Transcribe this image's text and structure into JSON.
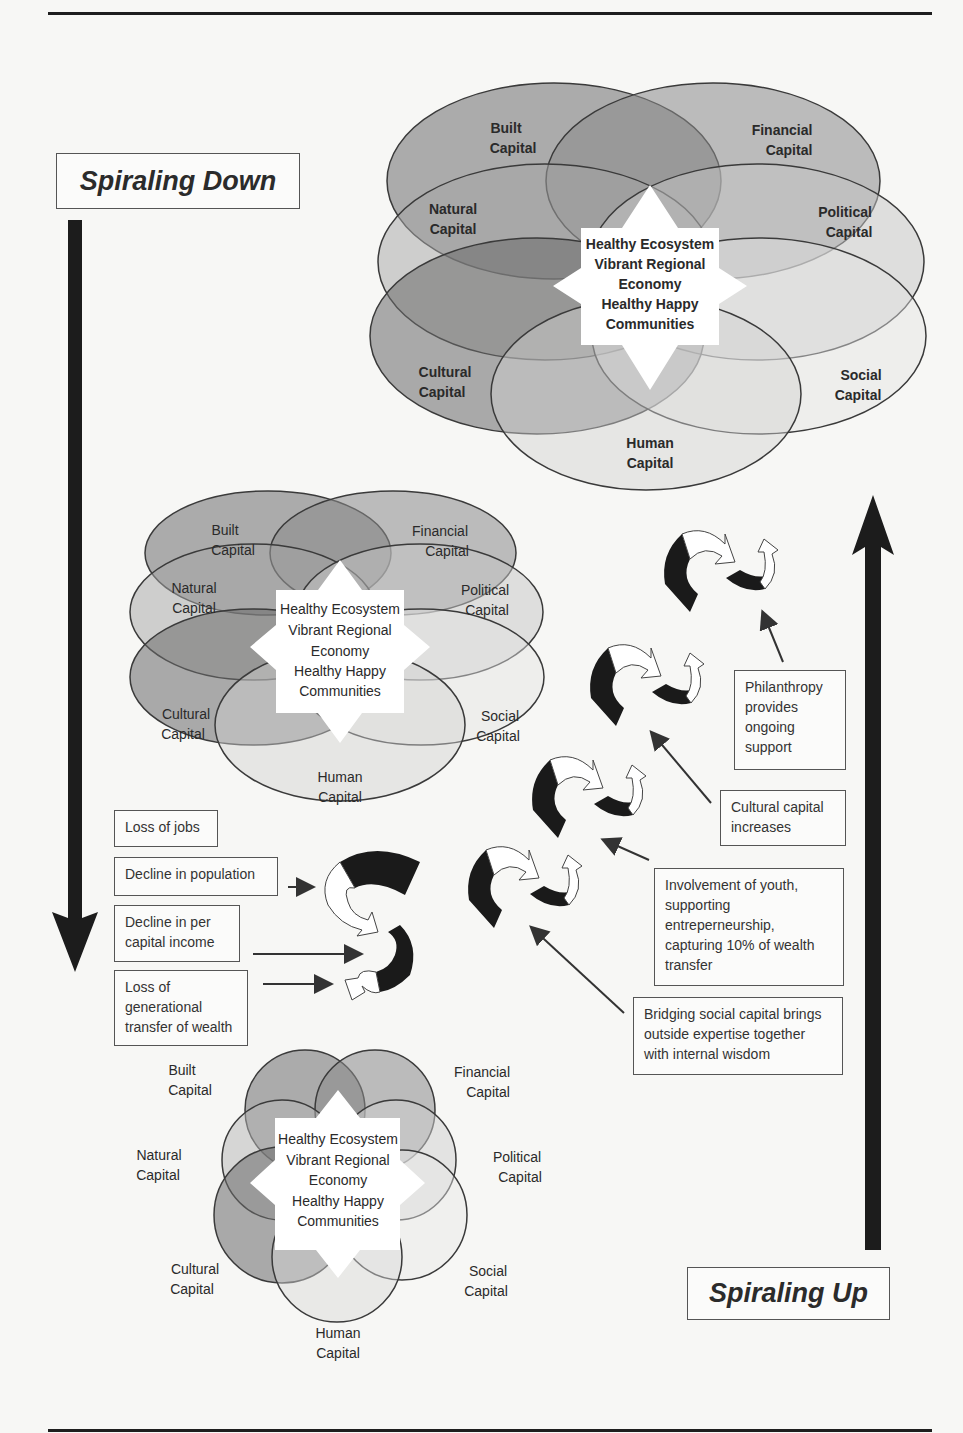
{
  "diagram": {
    "spiral_down_label": "Spiraling Down",
    "spiral_up_label": "Spiraling Up",
    "center_text": [
      "Healthy Ecosystem",
      "Vibrant Regional",
      "Economy",
      "Healthy Happy",
      "Communities"
    ],
    "capitals": {
      "built": [
        "Built",
        "Capital"
      ],
      "financial": [
        "Financial",
        "Capital"
      ],
      "natural": [
        "Natural",
        "Capital"
      ],
      "political": [
        "Political",
        "Capital"
      ],
      "cultural": [
        "Cultural",
        "Capital"
      ],
      "social": [
        "Social",
        "Capital"
      ],
      "human": [
        "Human",
        "Capital"
      ]
    },
    "decline_factors": [
      "Loss of jobs",
      "Decline in population",
      "Decline in per capital income",
      "Loss of generational transfer of wealth"
    ],
    "growth_factors": [
      "Philanthropy provides ongoing support",
      "Cultural capital increases",
      "Involvement of youth, supporting entreperneurship, capturing 10% of wealth transfer",
      "Bridging social capital brings outside expertise together with internal wisdom"
    ],
    "colors": {
      "dark_fill": "#6e6e6e",
      "mid_fill": "#9a9a9a",
      "light_fill": "#c8c8c8",
      "outline": "#3a3a3a",
      "arrow": "#1c1c1c"
    }
  }
}
